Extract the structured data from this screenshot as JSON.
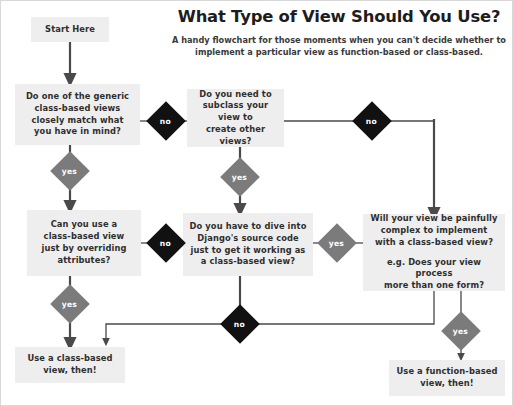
{
  "header": {
    "title": "What Type of View Should You Use?",
    "subtitle": "A handy flowchart for those moments when you can't decide whether to implement a particular view as function-based or class-based."
  },
  "colors": {
    "background": "#ffffff",
    "node_fill": "#eeeeee",
    "node_text": "#2e2e2e",
    "edge": "#4a4a4a",
    "diamond_no": "#111111",
    "diamond_yes": "#7b7b7b",
    "diamond_label": "#ffffff"
  },
  "nodes": {
    "start": {
      "label": "Start Here"
    },
    "generic_views": {
      "line1": "Do one of the generic",
      "line2": "class-based views",
      "line3": "closely match what",
      "line4": "you have in mind?"
    },
    "subclass": {
      "line1": "Do you need to",
      "line2": "subclass your view to",
      "line3": "create other views?"
    },
    "attributes": {
      "line1": "Can you use a",
      "line2": "class-based view",
      "line3": "just by overriding",
      "line4": "attributes?"
    },
    "source_code": {
      "line1": "Do you have to dive into",
      "line2": "Django's source code",
      "line3": "just to get it working as",
      "line4": "a class-based view?"
    },
    "complex": {
      "question_line1": "Will your view be painfully",
      "question_line2": "complex to implement",
      "question_line3": "with a class-based view?",
      "example_line1": "e.g. Does your view process",
      "example_line2": "more than one form?"
    },
    "outcome_class_based": {
      "line1": "Use a class-based",
      "line2": "view, then!"
    },
    "outcome_function_based": {
      "line1": "Use a function-based",
      "line2": "view, then!"
    }
  },
  "decisions": {
    "generic_no": "no",
    "generic_yes": "yes",
    "subclass_no": "no",
    "subclass_yes": "yes",
    "attributes_no": "no",
    "attributes_yes": "yes",
    "source_yes": "yes",
    "complex_no": "no",
    "complex_yes": "yes"
  }
}
